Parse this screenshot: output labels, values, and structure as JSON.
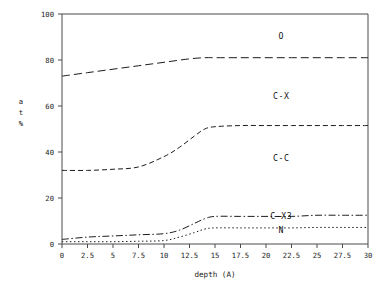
{
  "chart_data": {
    "type": "line",
    "title": "",
    "subtitle": "",
    "xlabel": "depth (A)",
    "ylabel": "at %",
    "ylabel_chars": [
      "a",
      "t",
      "%"
    ],
    "xlim": [
      0,
      30
    ],
    "ylim": [
      0,
      100
    ],
    "grid": false,
    "legend_position": "inline-annotations",
    "x_ticks": [
      "0",
      "2.5",
      "5",
      "7.5",
      "10",
      "12.5",
      "15",
      "17.5",
      "20",
      "22.5",
      "25",
      "27.5",
      "30"
    ],
    "x_tick_values": [
      0,
      2.5,
      5,
      7.5,
      10,
      12.5,
      15,
      17.5,
      20,
      22.5,
      25,
      27.5,
      30
    ],
    "y_ticks": [
      "0",
      "20",
      "40",
      "60",
      "80",
      "100"
    ],
    "y_tick_values": [
      0,
      20,
      40,
      60,
      80,
      100
    ],
    "series": [
      {
        "name": "O",
        "dash": "8 4",
        "label_x": 21.5,
        "label_y": 89,
        "x": [
          0,
          2.5,
          5,
          7.5,
          10,
          12.5,
          14,
          15,
          17.5,
          20,
          22.5,
          25,
          27.5,
          30
        ],
        "values": [
          73,
          74.5,
          76,
          77.5,
          79,
          80.5,
          81,
          81,
          81,
          81,
          81,
          81,
          81,
          81
        ]
      },
      {
        "name": "C-X",
        "dash": "",
        "label_x": 21.5,
        "label_y": 63,
        "x": [],
        "values": []
      },
      {
        "name": "C-C",
        "dash": "5 3",
        "label_x": 21.5,
        "label_y": 36,
        "x": [
          0,
          2.5,
          5,
          7.5,
          10,
          11.5,
          13,
          14,
          15,
          17.5,
          20,
          22.5,
          25,
          27.5,
          30
        ],
        "values": [
          32,
          32,
          32.5,
          33.5,
          38,
          42,
          47,
          50,
          51,
          51.5,
          51.5,
          51.5,
          51.5,
          51.5,
          51.5
        ]
      },
      {
        "name": "C-X3",
        "dash": "7 2.5 1.5 2.5",
        "label_x": 21.5,
        "label_y": 11,
        "x": [
          0,
          2.5,
          5,
          7.5,
          10,
          11.5,
          13,
          14,
          15,
          17.5,
          20,
          22.5,
          25,
          27.5,
          30
        ],
        "values": [
          2,
          3,
          3.5,
          4,
          4.5,
          6,
          9,
          11,
          12,
          12,
          12,
          12,
          12.5,
          12.5,
          12.5
        ]
      },
      {
        "name": "N",
        "dash": "1.5 2.5",
        "label_x": 21.5,
        "label_y": 5,
        "x": [
          0,
          2.5,
          5,
          7.5,
          10,
          11.5,
          13,
          14,
          15,
          17.5,
          20,
          22.5,
          25,
          27.5,
          30
        ],
        "values": [
          1,
          1,
          1,
          1.2,
          1.5,
          3,
          5,
          6.5,
          7,
          7,
          7,
          7,
          7.2,
          7.2,
          7.2
        ]
      }
    ],
    "annotations": [
      {
        "text": "O",
        "x": 21.5,
        "y": 89
      },
      {
        "text": "C-X",
        "x": 21.5,
        "y": 63
      },
      {
        "text": "C-C",
        "x": 21.5,
        "y": 36
      },
      {
        "text": "C-X3",
        "x": 21.5,
        "y": 11
      },
      {
        "text": "N",
        "x": 21.5,
        "y": 5
      }
    ],
    "colors": {
      "background": "#ffffff",
      "line": "#1d1d1d",
      "axis": "#4a4a4a",
      "text": "#1b1b1b"
    }
  }
}
